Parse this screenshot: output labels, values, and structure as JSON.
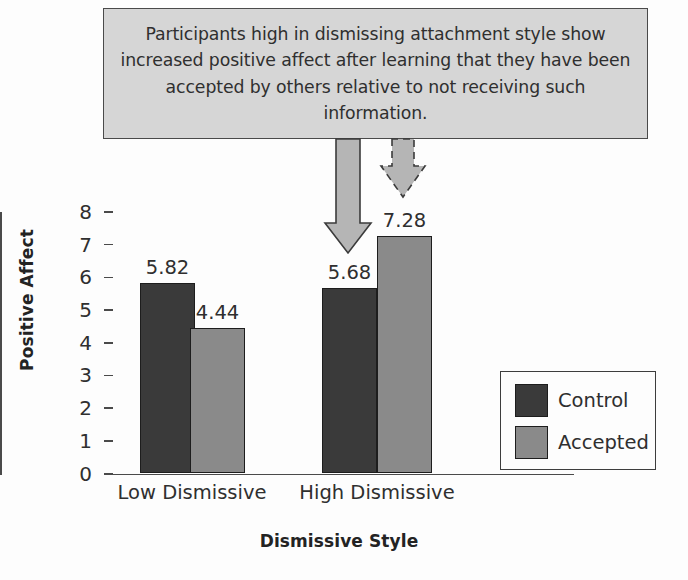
{
  "callout": {
    "text": "Participants high in dismissing attachment style show increased positive affect after learning that they have been accepted by others relative to not receiving such information."
  },
  "annotations": {
    "solid_arrow_name": "solid-down-arrow",
    "dashed_arrow_name": "dashed-down-arrow"
  },
  "colors": {
    "control": "#3a3a3a",
    "accepted": "#8a8a8a",
    "callout_bg": "#d6d6d6",
    "outline": "#1d1d1d",
    "arrow_fill": "#b5b5b5",
    "background": "#fdfdfd"
  },
  "legend": {
    "items": [
      {
        "label": "Control",
        "color": "#3a3a3a"
      },
      {
        "label": "Accepted",
        "color": "#8a8a8a"
      }
    ]
  },
  "chart_data": {
    "type": "bar",
    "title": "",
    "xlabel": "Dismissive Style",
    "ylabel": "Positive Affect",
    "categories": [
      "Low Dismissive",
      "High Dismissive"
    ],
    "series": [
      {
        "name": "Control",
        "values": [
          5.82,
          5.68
        ],
        "color": "#3a3a3a"
      },
      {
        "name": "Accepted",
        "values": [
          4.44,
          7.28
        ],
        "color": "#8a8a8a"
      }
    ],
    "value_labels": [
      "5.82",
      "4.44",
      "5.68",
      "7.28"
    ],
    "ylim": [
      0,
      8
    ],
    "yticks": [
      0,
      1,
      2,
      3,
      4,
      5,
      6,
      7,
      8
    ],
    "ytick_labels": [
      "0",
      "1",
      "2",
      "3",
      "4",
      "5",
      "6",
      "7",
      "8"
    ],
    "grid": false,
    "legend_position": "right"
  }
}
